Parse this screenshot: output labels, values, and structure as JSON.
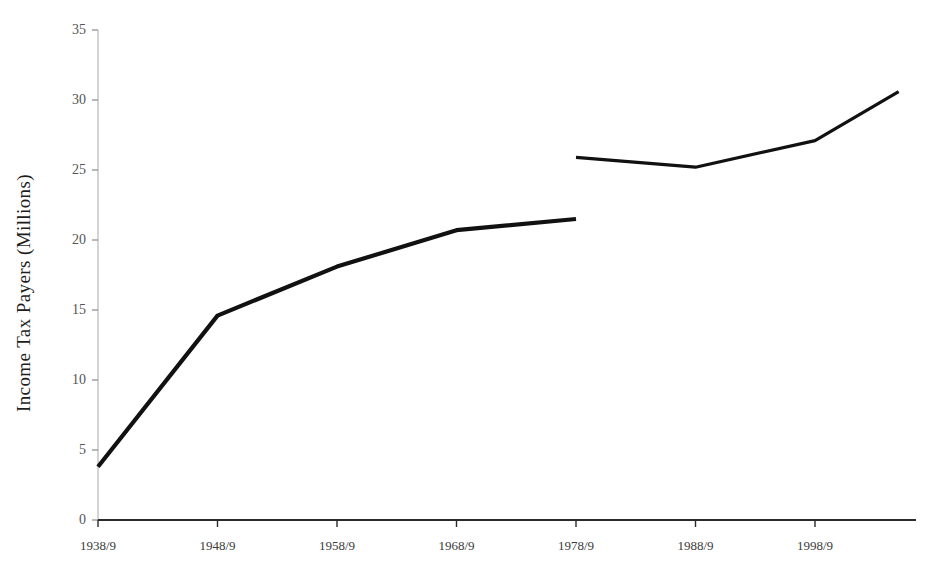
{
  "chart_data": {
    "type": "line",
    "title": "",
    "subtitle": "",
    "xlabel": "",
    "ylabel": "Income Tax Payers (Millions)",
    "xlim": [
      1938,
      2006
    ],
    "ylim": [
      0,
      35
    ],
    "grid": false,
    "legend": null,
    "legend_position": "none",
    "x_tick_labels": [
      "1938/9",
      "1948/9",
      "1958/9",
      "1968/9",
      "1978/9",
      "1988/9",
      "1998/9"
    ],
    "x_tick_values": [
      1938,
      1948,
      1958,
      1968,
      1978,
      1988,
      1998
    ],
    "y_tick_labels": [
      "0",
      "5",
      "10",
      "15",
      "20",
      "25",
      "30",
      "35"
    ],
    "y_tick_values": [
      0,
      5,
      10,
      15,
      20,
      25,
      30,
      35
    ],
    "series": [
      {
        "name": "Income tax payers (earlier basis)",
        "x": [
          1938,
          1948,
          1958,
          1968,
          1978
        ],
        "values": [
          3.8,
          14.6,
          18.1,
          20.7,
          21.5
        ]
      },
      {
        "name": "Income tax payers (later basis)",
        "x": [
          1978,
          1988,
          1998,
          2005
        ],
        "values": [
          25.9,
          25.2,
          27.1,
          30.6
        ]
      }
    ]
  },
  "style": {
    "line_color": "#111111",
    "y_axis_color": "#c9c9c9",
    "x_axis_color": "#2a2a2a",
    "tick_color": "#9a9a9a",
    "background": "#ffffff"
  }
}
